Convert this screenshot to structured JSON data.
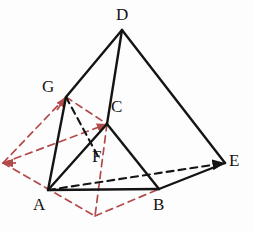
{
  "figure": {
    "colors": {
      "solid_edge": "#141414",
      "hidden_edge": "#141414",
      "auxiliary": "#b34a4a",
      "background": "#fdfdfd",
      "label_text": "#141414"
    },
    "vertices": [
      {
        "name": "D",
        "label": "D",
        "x": 122,
        "y": 30,
        "label_x": 116,
        "label_y": 6
      },
      {
        "name": "G",
        "label": "G",
        "x": 66,
        "y": 97,
        "label_x": 42,
        "label_y": 78
      },
      {
        "name": "C",
        "label": "C",
        "x": 107,
        "y": 124,
        "label_x": 111,
        "label_y": 98
      },
      {
        "name": "F",
        "label": "F",
        "x": 100,
        "y": 160,
        "label_x": 92,
        "label_y": 148
      },
      {
        "name": "E",
        "label": "E",
        "x": 225,
        "y": 163,
        "label_x": 229,
        "label_y": 152
      },
      {
        "name": "A",
        "label": "A",
        "x": 48,
        "y": 190,
        "label_x": 33,
        "label_y": 196
      },
      {
        "name": "B",
        "label": "B",
        "x": 159,
        "y": 189,
        "label_x": 153,
        "label_y": 196
      }
    ],
    "aux_points": [
      {
        "name": "left-apex",
        "x": 3,
        "y": 163
      },
      {
        "name": "bottom-apex",
        "x": 95,
        "y": 216
      }
    ],
    "solid_edges": [
      {
        "name": "edge-D-G",
        "from": "D",
        "to": "G"
      },
      {
        "name": "edge-D-C",
        "from": "D",
        "to": "C"
      },
      {
        "name": "edge-D-E",
        "from": "D",
        "to": "E"
      },
      {
        "name": "edge-G-A",
        "from": "G",
        "to": "A"
      },
      {
        "name": "edge-C-A",
        "from": "C",
        "to": "A"
      },
      {
        "name": "edge-C-B",
        "from": "C",
        "to": "B"
      },
      {
        "name": "edge-A-B",
        "from": "A",
        "to": "B"
      },
      {
        "name": "edge-B-E",
        "from": "B",
        "to": "E"
      }
    ],
    "hidden_edges": [
      {
        "name": "edge-G-F-hidden",
        "from": "G",
        "to": "F"
      },
      {
        "name": "edge-A-E-hidden",
        "from": "A",
        "to": "E",
        "arrow": true
      }
    ],
    "aux_edges": [
      {
        "name": "aux-left-to-G",
        "from": "left-apex",
        "to": "G"
      },
      {
        "name": "aux-left-to-bottom",
        "from": "left-apex",
        "to": "bottom-apex"
      },
      {
        "name": "aux-G-to-C",
        "from": "G",
        "to": "C"
      },
      {
        "name": "aux-C-to-bottom",
        "from": "C",
        "to": "bottom-apex"
      },
      {
        "name": "aux-left-to-C",
        "from": "left-apex",
        "to": "C",
        "arrow": true
      },
      {
        "name": "aux-bottom-to-B",
        "from": "bottom-apex",
        "to": "B"
      }
    ]
  }
}
